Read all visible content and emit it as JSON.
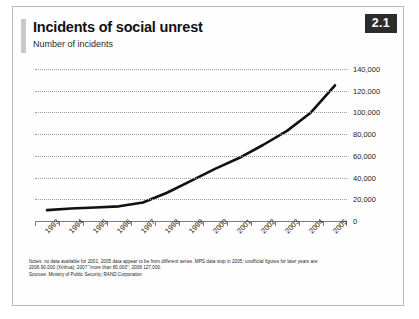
{
  "header": {
    "title": "Incidents of social unrest",
    "subtitle": "Number of incidents",
    "badge": "2.1"
  },
  "notes": {
    "line1": "Notes: no data available for 2001; 2005 data appear to be from different series. MPS data stop in 2005; unofficial figures for later years are:",
    "line2": "2006 90,000 (Xinhua); 2007 \"more than 80,000\"; 2008 127,000.",
    "sources": "Sources: Ministry of Public Security; RAND Corporation"
  },
  "colors": {
    "line": "#111111",
    "grid": "#9a9a9a",
    "axis": "#7d7d7d",
    "badge_bg": "#2c2c2c",
    "accent": "#c9c9c9"
  },
  "chart_data": {
    "type": "line",
    "title": "Incidents of social unrest",
    "subtitle": "Number of incidents",
    "xlabel": "",
    "ylabel": "Number of incidents",
    "categories": [
      "1993",
      "1994",
      "1995",
      "1996",
      "1997",
      "1998",
      "1999",
      "2000",
      "2001",
      "2002",
      "2003",
      "2004",
      "2005"
    ],
    "values": [
      10000,
      11500,
      12500,
      13500,
      17000,
      26000,
      37000,
      48000,
      58000,
      70000,
      83000,
      100000,
      125000
    ],
    "ylim": [
      0,
      140000
    ],
    "yticks": [
      0,
      20000,
      40000,
      60000,
      80000,
      100000,
      120000,
      140000
    ],
    "ytick_labels": [
      "0",
      "20,000",
      "40,000",
      "60,000",
      "80,000",
      "100,000",
      "120,000",
      "140,000"
    ],
    "grid": true,
    "grid_style": "dotted-horizontal",
    "legend": "none",
    "series": [
      {
        "name": "Incidents of social unrest",
        "values": [
          10000,
          11500,
          12500,
          13500,
          17000,
          26000,
          37000,
          48000,
          58000,
          70000,
          83000,
          100000,
          125000
        ]
      }
    ]
  }
}
